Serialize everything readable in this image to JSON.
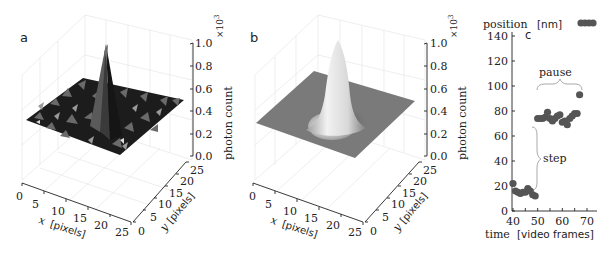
{
  "chart_data": [
    {
      "panel": "a",
      "type": "surface3d",
      "description": "Noisy measured intensity image: flat noisy background with a sharp central peak",
      "xlabel": "x [pixels]",
      "ylabel": "y [pixels]",
      "zlabel": "photon count",
      "z_multiplier": "×10^3",
      "x_ticks": [
        "0",
        "5",
        "10",
        "15",
        "20",
        "25"
      ],
      "y_ticks": [
        "0",
        "5",
        "10",
        "15",
        "20",
        "25"
      ],
      "z_ticks": [
        "0.0",
        "0.2",
        "0.4",
        "0.6",
        "0.8",
        "1.0"
      ],
      "xlim": [
        0,
        25
      ],
      "ylim": [
        0,
        25
      ],
      "zlim": [
        0.0,
        1.0
      ],
      "peak_center": [
        12.5,
        12.5
      ],
      "peak_height": 1.0,
      "background_level": 0.35,
      "grid": true
    },
    {
      "panel": "b",
      "type": "surface3d",
      "description": "Fitted Gaussian model: flat plane with smooth 2D Gaussian peak",
      "xlabel": "x [pixels]",
      "ylabel": "y [pixels]",
      "zlabel": "photon count",
      "z_multiplier": "×10^3",
      "x_ticks": [
        "0",
        "5",
        "10",
        "15",
        "20",
        "25"
      ],
      "y_ticks": [
        "0",
        "5",
        "10",
        "15",
        "20",
        "25"
      ],
      "z_ticks": [
        "0.0",
        "0.2",
        "0.4",
        "0.6",
        "0.8",
        "1.0"
      ],
      "xlim": [
        0,
        25
      ],
      "ylim": [
        0,
        25
      ],
      "zlim": [
        0.0,
        1.0
      ],
      "peak_center": [
        12.5,
        12.5
      ],
      "peak_height": 1.0,
      "background_level": 0.35,
      "grid": true
    },
    {
      "panel": "c",
      "type": "scatter",
      "title": "position [nm]",
      "xlabel": "time [video frames]",
      "ylabel": "position [nm]",
      "x_ticks": [
        "40",
        "50",
        "60",
        "70"
      ],
      "y_ticks": [
        "0",
        "20",
        "40",
        "60",
        "80",
        "100",
        "120",
        "140"
      ],
      "xlim": [
        40,
        73
      ],
      "ylim": [
        0,
        145
      ],
      "annotations": [
        {
          "text": "pause",
          "type": "horizontal-brace",
          "x_range": [
            50,
            65
          ],
          "y": 97
        },
        {
          "text": "step",
          "type": "vertical-brace",
          "x": 49.5,
          "y_range": [
            18,
            70
          ]
        }
      ],
      "legend_marker": "filled circle (dark gray)",
      "series": [
        {
          "name": "position",
          "color": "#555555",
          "x": [
            40,
            41,
            42,
            43,
            44,
            45,
            46,
            47,
            48,
            49,
            50,
            51,
            52,
            53,
            54,
            55,
            56,
            57,
            58,
            59,
            60,
            61,
            62,
            63,
            64,
            65,
            66,
            67
          ],
          "y": [
            22,
            16,
            15,
            14,
            15,
            15,
            18,
            16,
            13,
            12,
            74,
            74,
            74,
            75,
            79,
            74,
            72,
            74,
            76,
            77,
            71,
            72,
            69,
            74,
            76,
            78,
            78,
            93
          ]
        }
      ]
    }
  ],
  "labels": {
    "panel_a": "a",
    "panel_b": "b",
    "panel_c": "c",
    "z_axis_label": "photon count",
    "z_multiplier": "×10",
    "z_exponent": "3",
    "x_axis_var": "x",
    "y_axis_var": "y",
    "pixels_unit": "[pixels]",
    "c_ylabel": "position",
    "c_yunit": "[nm]",
    "c_xlabel": "time",
    "c_xunit": "[video frames]",
    "pause": "pause",
    "step": "step"
  },
  "colors": {
    "axis": "#222222",
    "grid": "#e4e4e4",
    "points": "#555555",
    "brace": "#aaaaaa",
    "surface_noise_dark": "#1a1a1a",
    "plane_gray": "#7a7a7a"
  }
}
